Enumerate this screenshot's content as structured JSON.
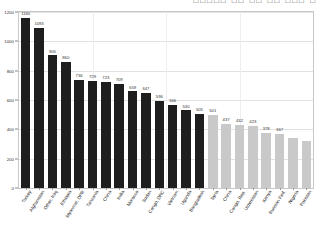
{
  "header": {
    "cjk_clipped_text": "□□□□□ □□  □□ □□   □□□  □"
  },
  "chart_data": {
    "type": "bar",
    "title": "",
    "xlabel": "",
    "ylabel": "",
    "ylim": [
      0,
      1200
    ],
    "yticks": [
      0,
      200,
      400,
      600,
      800,
      1000,
      1200
    ],
    "ytick_labels": [
      "0",
      "200",
      "400",
      "600",
      "800",
      "1000",
      "1200"
    ],
    "grid": true,
    "legend": "none",
    "categories": [
      "Turkey",
      "Afghanistan",
      "Other, Iraq",
      "Ethiopia",
      "Myanmar, DPR",
      "Tanzania",
      "China",
      "India",
      "Morocco",
      "Sudan",
      "Congo, DRC",
      "Vietnam",
      "Uganda",
      "Bangladesh",
      "Syria",
      "China",
      "Congo, Rep.",
      "Uzbekistan",
      "Kenya",
      "Russian Fed.",
      "Nigeria",
      "Pakistan"
    ],
    "values": [
      1160,
      1093,
      905,
      860,
      736,
      729,
      723,
      709,
      659,
      647,
      596,
      566,
      530,
      505,
      501,
      437,
      432,
      423,
      378,
      367,
      340,
      320
    ],
    "value_labels": [
      "1160",
      "1093",
      "905",
      "860",
      "736",
      "729",
      "723",
      "709",
      "659",
      "647",
      "596",
      "566",
      "530",
      "505",
      "501",
      "437",
      "432",
      "423",
      "378",
      "367",
      "",
      ""
    ],
    "series_colors": {
      "dark": "#1e1e1e",
      "light": "#c9c9c9"
    },
    "dark_count": 14
  }
}
